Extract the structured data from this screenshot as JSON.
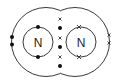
{
  "diagram": {
    "type": "dot-and-cross",
    "molecule": "N2",
    "atoms": [
      {
        "symbol": "N",
        "center": [
          38,
          42
        ],
        "electron_marker": "dot"
      },
      {
        "symbol": "N",
        "center": [
          81,
          42
        ],
        "electron_marker": "cross"
      }
    ],
    "shared_electrons": {
      "crosses": 3,
      "dots": 3
    },
    "lone_pairs": {
      "left": "dots",
      "right": "crosses"
    },
    "colors": {
      "line": "#3a3a3a",
      "marker": "#111111",
      "background": "#ffffff"
    }
  }
}
